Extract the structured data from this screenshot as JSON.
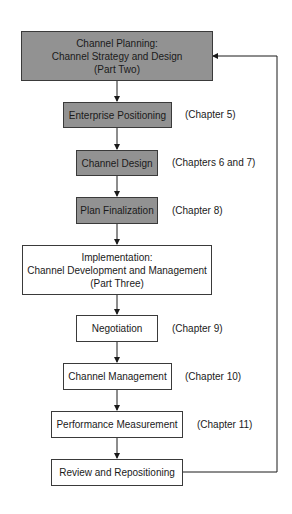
{
  "diagram": {
    "nodes": [
      {
        "id": "planning",
        "lines": [
          "Channel Planning:",
          "Channel Strategy and Design",
          "(Part Two)"
        ],
        "style": "shaded",
        "chapter": ""
      },
      {
        "id": "enterprise",
        "lines": [
          "Enterprise Positioning"
        ],
        "style": "shaded",
        "chapter": "(Chapter 5)"
      },
      {
        "id": "design",
        "lines": [
          "Channel Design"
        ],
        "style": "shaded",
        "chapter": "(Chapters 6 and 7)"
      },
      {
        "id": "finalization",
        "lines": [
          "Plan Finalization"
        ],
        "style": "shaded",
        "chapter": "(Chapter 8)"
      },
      {
        "id": "implementation",
        "lines": [
          "Implementation:",
          "Channel Development and Management",
          "(Part Three)"
        ],
        "style": "plain",
        "chapter": ""
      },
      {
        "id": "negotiation",
        "lines": [
          "Negotiation"
        ],
        "style": "plain",
        "chapter": "(Chapter 9)"
      },
      {
        "id": "management",
        "lines": [
          "Channel Management"
        ],
        "style": "plain",
        "chapter": "(Chapter 10)"
      },
      {
        "id": "performance",
        "lines": [
          "Performance Measurement"
        ],
        "style": "plain",
        "chapter": "(Chapter 11)"
      },
      {
        "id": "review",
        "lines": [
          "Review and Repositioning"
        ],
        "style": "plain",
        "chapter": ""
      }
    ],
    "edges": [
      [
        "planning",
        "enterprise"
      ],
      [
        "enterprise",
        "design"
      ],
      [
        "design",
        "finalization"
      ],
      [
        "finalization",
        "implementation"
      ],
      [
        "implementation",
        "negotiation"
      ],
      [
        "negotiation",
        "management"
      ],
      [
        "management",
        "performance"
      ],
      [
        "performance",
        "review"
      ],
      [
        "review",
        "planning"
      ]
    ],
    "colors": {
      "shaded_fill": "#929292",
      "border": "#3a3a3a",
      "background": "#ffffff"
    }
  }
}
